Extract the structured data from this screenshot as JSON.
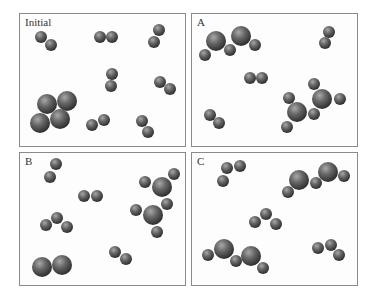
{
  "colors": {
    "border": "#8a8a8a",
    "atom_light": "#9a9a9a",
    "atom_mid": "#5e5e5e",
    "atom_dark": "#2e2e2e"
  },
  "radii": {
    "small": 6,
    "large": 10
  },
  "panels": [
    {
      "label": "Initial",
      "box": [
        19,
        13,
        167,
        134
      ],
      "atoms": [
        [
          41,
          37,
          "s"
        ],
        [
          51,
          45,
          "s"
        ],
        [
          100,
          37,
          "s"
        ],
        [
          112,
          37,
          "s"
        ],
        [
          159,
          30,
          "s"
        ],
        [
          154,
          42,
          "s"
        ],
        [
          112,
          74,
          "s"
        ],
        [
          111,
          86,
          "s"
        ],
        [
          160,
          82,
          "s"
        ],
        [
          170,
          89,
          "s"
        ],
        [
          47,
          104,
          "l"
        ],
        [
          67,
          101,
          "l"
        ],
        [
          40,
          123,
          "l"
        ],
        [
          60,
          119,
          "l"
        ],
        [
          92,
          125,
          "s"
        ],
        [
          104,
          120,
          "s"
        ],
        [
          142,
          121,
          "s"
        ],
        [
          148,
          132,
          "s"
        ]
      ]
    },
    {
      "label": "A",
      "box": [
        191,
        13,
        167,
        134
      ],
      "atoms": [
        [
          216,
          41,
          "l"
        ],
        [
          241,
          36,
          "l"
        ],
        [
          205,
          55,
          "s"
        ],
        [
          230,
          50,
          "s"
        ],
        [
          255,
          45,
          "s"
        ],
        [
          329,
          32,
          "s"
        ],
        [
          325,
          43,
          "s"
        ],
        [
          250,
          78,
          "s"
        ],
        [
          262,
          78,
          "s"
        ],
        [
          314,
          84,
          "s"
        ],
        [
          322,
          99,
          "l"
        ],
        [
          340,
          99,
          "s"
        ],
        [
          289,
          98,
          "s"
        ],
        [
          297,
          112,
          "l"
        ],
        [
          314,
          114,
          "s"
        ],
        [
          287,
          127,
          "s"
        ],
        [
          210,
          115,
          "s"
        ],
        [
          219,
          123,
          "s"
        ]
      ]
    },
    {
      "label": "B",
      "box": [
        19,
        152,
        167,
        134
      ],
      "atoms": [
        [
          56,
          164,
          "s"
        ],
        [
          50,
          177,
          "s"
        ],
        [
          84,
          196,
          "s"
        ],
        [
          97,
          196,
          "s"
        ],
        [
          145,
          182,
          "s"
        ],
        [
          162,
          187,
          "l"
        ],
        [
          174,
          174,
          "s"
        ],
        [
          167,
          204,
          "s"
        ],
        [
          136,
          210,
          "s"
        ],
        [
          153,
          215,
          "l"
        ],
        [
          157,
          232,
          "s"
        ],
        [
          46,
          225,
          "s"
        ],
        [
          57,
          218,
          "s"
        ],
        [
          67,
          227,
          "s"
        ],
        [
          42,
          267,
          "l"
        ],
        [
          62,
          265,
          "l"
        ],
        [
          115,
          252,
          "s"
        ],
        [
          126,
          259,
          "s"
        ]
      ]
    },
    {
      "label": "C",
      "box": [
        191,
        152,
        167,
        134
      ],
      "atoms": [
        [
          227,
          168,
          "s"
        ],
        [
          240,
          166,
          "s"
        ],
        [
          223,
          181,
          "s"
        ],
        [
          288,
          192,
          "s"
        ],
        [
          299,
          180,
          "l"
        ],
        [
          316,
          183,
          "s"
        ],
        [
          328,
          172,
          "l"
        ],
        [
          344,
          176,
          "s"
        ],
        [
          255,
          222,
          "s"
        ],
        [
          266,
          214,
          "s"
        ],
        [
          276,
          224,
          "s"
        ],
        [
          208,
          255,
          "s"
        ],
        [
          224,
          249,
          "l"
        ],
        [
          236,
          261,
          "s"
        ],
        [
          251,
          256,
          "l"
        ],
        [
          263,
          268,
          "s"
        ],
        [
          318,
          248,
          "s"
        ],
        [
          331,
          245,
          "s"
        ],
        [
          339,
          255,
          "s"
        ]
      ]
    }
  ]
}
